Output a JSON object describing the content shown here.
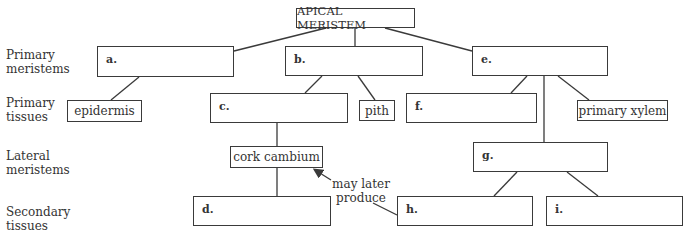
{
  "row_labels": {
    "primary_meristems": [
      "Primary",
      "meristems"
    ],
    "primary_tissues": [
      "Primary",
      "tissues"
    ],
    "lateral_meristems": [
      "Lateral",
      "meristems"
    ],
    "secondary_tissues": [
      "Secondary",
      "tissues"
    ]
  },
  "nodes": {
    "apical": "APICAL MERISTEM",
    "a": "a.",
    "b": "b.",
    "e": "e.",
    "epidermis": "epidermis",
    "c": "c.",
    "pith": "pith",
    "f": "f.",
    "primary_xylem": "primary xylem",
    "cork_cambium": "cork cambium",
    "g": "g.",
    "d": "d.",
    "h": "h.",
    "i": "i."
  },
  "annotation": {
    "line1": "may later",
    "line2": "produce"
  },
  "colors": {
    "line": "#3a3a3a",
    "text": "#333333"
  }
}
